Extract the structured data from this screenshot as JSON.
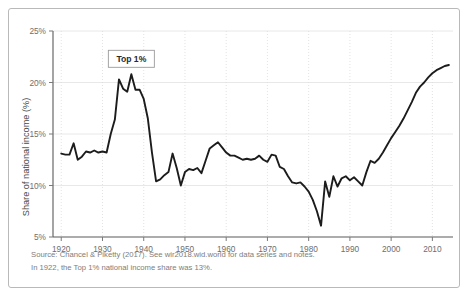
{
  "chart_data": {
    "type": "line",
    "title": "",
    "subtitle": "",
    "xlabel": "",
    "ylabel": "Share of national income (%)",
    "xlim": [
      1918,
      2015
    ],
    "ylim": [
      5,
      25
    ],
    "ytick_labels": [
      "5%",
      "10%",
      "15%",
      "20%",
      "25%"
    ],
    "ytick_values": [
      5,
      10,
      15,
      20,
      25
    ],
    "xtick_labels": [
      "1920",
      "1930",
      "1940",
      "1950",
      "1960",
      "1970",
      "1980",
      "1990",
      "2000",
      "2010"
    ],
    "xtick_values": [
      1920,
      1930,
      1940,
      1950,
      1960,
      1970,
      1980,
      1990,
      2000,
      2010
    ],
    "grid": true,
    "legend_position": "inside-top-left",
    "legend_entries": [
      "Top 1%"
    ],
    "series": [
      {
        "name": "Top 1%",
        "color": "#1c1c1c",
        "x": [
          1920,
          1921,
          1922,
          1923,
          1924,
          1925,
          1926,
          1927,
          1928,
          1929,
          1930,
          1931,
          1932,
          1933,
          1934,
          1935,
          1936,
          1937,
          1938,
          1939,
          1940,
          1941,
          1942,
          1943,
          1944,
          1945,
          1946,
          1947,
          1948,
          1949,
          1950,
          1951,
          1952,
          1953,
          1954,
          1955,
          1956,
          1957,
          1958,
          1959,
          1960,
          1961,
          1962,
          1963,
          1964,
          1965,
          1966,
          1967,
          1968,
          1969,
          1970,
          1971,
          1972,
          1973,
          1974,
          1975,
          1976,
          1977,
          1978,
          1979,
          1980,
          1981,
          1982,
          1983,
          1984,
          1985,
          1986,
          1987,
          1988,
          1989,
          1990,
          1991,
          1992,
          1993,
          1994,
          1995,
          1996,
          1997,
          1998,
          1999,
          2000,
          2001,
          2002,
          2003,
          2004,
          2005,
          2006,
          2007,
          2008,
          2009,
          2010,
          2011,
          2012,
          2013,
          2014
        ],
        "values": [
          13.1,
          13.0,
          13.0,
          14.1,
          12.5,
          12.8,
          13.3,
          13.2,
          13.4,
          13.2,
          13.3,
          13.2,
          15.0,
          16.4,
          20.3,
          19.4,
          19.1,
          20.8,
          19.3,
          19.3,
          18.4,
          16.5,
          13.2,
          10.4,
          10.6,
          11.0,
          11.3,
          13.1,
          11.7,
          10.0,
          11.3,
          11.6,
          11.5,
          11.7,
          11.2,
          12.4,
          13.6,
          13.9,
          14.2,
          13.7,
          13.2,
          12.9,
          12.9,
          12.7,
          12.5,
          12.6,
          12.5,
          12.6,
          12.9,
          12.5,
          12.3,
          13.0,
          12.9,
          11.8,
          11.6,
          10.9,
          10.3,
          10.2,
          10.3,
          9.9,
          9.4,
          8.6,
          7.5,
          6.1,
          10.4,
          8.9,
          10.9,
          9.9,
          10.7,
          10.9,
          10.5,
          10.8,
          10.4,
          10.0,
          11.3,
          12.4,
          12.2,
          12.6,
          13.2,
          13.9,
          14.6,
          15.2,
          15.8,
          16.5,
          17.3,
          18.1,
          19.0,
          19.6,
          20.0,
          20.5,
          20.9,
          21.2,
          21.4,
          21.6,
          21.7
        ]
      }
    ],
    "annotations": [
      {
        "type": "label-box",
        "text": "Top 1%",
        "x": 1937,
        "y": 22.3
      }
    ]
  },
  "footnotes": {
    "source_line": "Source: Chancel & Piketty (2017). See wir2018.wid.world for data series and notes.",
    "note_line": "In 1922, the Top 1% national income share was 13%."
  },
  "colors": {
    "series": "#1c1c1c",
    "grid": "#e2e2e2",
    "axis": "#5a5a5a",
    "text": "#6e6e6e",
    "frame_border": "#b9b9b9",
    "background": "#ffffff"
  }
}
